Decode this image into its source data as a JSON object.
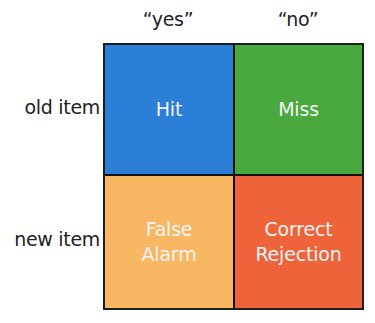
{
  "columns": [
    {
      "label": "“yes”"
    },
    {
      "label": "“no”"
    }
  ],
  "rows": [
    {
      "label": "old item"
    },
    {
      "label": "new item"
    }
  ],
  "cells": [
    {
      "label": "Hit",
      "color": "#2b7fd6"
    },
    {
      "label": "Miss",
      "color": "#4aa93e"
    },
    {
      "label": "False\nAlarm",
      "color": "#f8b762"
    },
    {
      "label": "Correct\nRejection",
      "color": "#ee6339"
    }
  ]
}
